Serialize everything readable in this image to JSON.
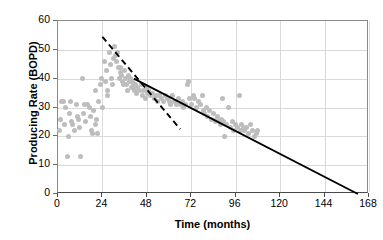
{
  "chart_data": {
    "type": "scatter",
    "title": "",
    "xlabel": "Time (months)",
    "ylabel": "Producing Rate (BOPD)",
    "xlim": [
      0,
      168
    ],
    "ylim": [
      0,
      60
    ],
    "xticks": [
      0,
      24,
      48,
      72,
      96,
      120,
      144,
      168
    ],
    "yticks": [
      0,
      10,
      20,
      30,
      40,
      50,
      60
    ],
    "grid": true,
    "legend": "none",
    "series": [
      {
        "name": "Producing rate data",
        "type": "scatter",
        "marker": "circle",
        "color": "#bdbdbd",
        "points": [
          [
            1,
            22
          ],
          [
            1.5,
            26
          ],
          [
            2,
            32
          ],
          [
            3,
            32
          ],
          [
            3.5,
            24
          ],
          [
            4,
            30
          ],
          [
            5,
            13
          ],
          [
            5.5,
            20
          ],
          [
            6,
            28
          ],
          [
            7,
            32
          ],
          [
            7.5,
            25
          ],
          [
            8,
            24
          ],
          [
            9,
            22
          ],
          [
            10,
            31
          ],
          [
            10.5,
            27
          ],
          [
            11,
            26
          ],
          [
            11.5,
            23
          ],
          [
            12,
            13
          ],
          [
            13,
            40
          ],
          [
            14,
            28
          ],
          [
            14.5,
            31
          ],
          [
            15,
            25
          ],
          [
            16,
            31
          ],
          [
            17,
            30
          ],
          [
            17.5,
            27
          ],
          [
            18,
            22
          ],
          [
            18.5,
            21
          ],
          [
            19,
            29
          ],
          [
            20,
            36
          ],
          [
            20.5,
            24
          ],
          [
            21,
            26
          ],
          [
            21.5,
            21
          ],
          [
            22,
            32
          ],
          [
            23,
            38
          ],
          [
            23.5,
            40
          ],
          [
            24,
            30
          ],
          [
            25,
            46
          ],
          [
            25.5,
            39
          ],
          [
            26,
            43
          ],
          [
            26.5,
            36
          ],
          [
            27,
            34
          ],
          [
            28,
            49
          ],
          [
            28.5,
            45
          ],
          [
            29,
            40
          ],
          [
            29.5,
            38
          ],
          [
            30,
            47
          ],
          [
            30.5,
            51
          ],
          [
            31,
            48
          ],
          [
            31.5,
            46
          ],
          [
            32,
            49
          ],
          [
            32.5,
            44
          ],
          [
            33,
            40
          ],
          [
            33.5,
            42
          ],
          [
            34,
            44
          ],
          [
            34.5,
            41
          ],
          [
            35,
            39
          ],
          [
            35.5,
            38
          ],
          [
            36,
            43
          ],
          [
            36.5,
            40
          ],
          [
            37,
            38
          ],
          [
            37.5,
            36
          ],
          [
            38,
            41
          ],
          [
            38.5,
            39
          ],
          [
            39,
            40
          ],
          [
            39.5,
            37
          ],
          [
            40,
            39
          ],
          [
            40.5,
            37
          ],
          [
            41,
            38
          ],
          [
            41.5,
            36
          ],
          [
            42,
            38
          ],
          [
            42.5,
            35
          ],
          [
            43,
            37
          ],
          [
            44,
            36
          ],
          [
            45,
            38
          ],
          [
            45.5,
            34
          ],
          [
            46,
            36
          ],
          [
            47,
            33
          ],
          [
            48,
            37
          ],
          [
            48.5,
            35
          ],
          [
            49,
            36
          ],
          [
            50,
            34
          ],
          [
            51,
            35
          ],
          [
            52,
            33
          ],
          [
            53,
            34
          ],
          [
            54,
            32
          ],
          [
            55,
            34
          ],
          [
            56,
            33
          ],
          [
            57,
            32
          ],
          [
            58,
            34
          ],
          [
            59,
            33
          ],
          [
            60,
            32
          ],
          [
            61,
            31
          ],
          [
            62,
            34
          ],
          [
            63,
            32
          ],
          [
            64,
            31
          ],
          [
            65,
            33
          ],
          [
            66,
            31
          ],
          [
            67,
            32
          ],
          [
            68,
            30
          ],
          [
            69,
            31
          ],
          [
            70,
            38
          ],
          [
            70.5,
            39
          ],
          [
            71,
            33
          ],
          [
            72,
            31
          ],
          [
            73,
            34
          ],
          [
            74,
            33
          ],
          [
            75,
            30
          ],
          [
            76,
            32
          ],
          [
            77,
            31
          ],
          [
            78,
            34
          ],
          [
            78.5,
            29
          ],
          [
            79,
            28
          ],
          [
            80,
            30
          ],
          [
            81,
            27
          ],
          [
            82,
            29
          ],
          [
            83,
            26
          ],
          [
            84,
            28
          ],
          [
            85,
            25
          ],
          [
            85.5,
            26
          ],
          [
            86,
            27
          ],
          [
            87,
            25
          ],
          [
            88,
            24
          ],
          [
            88.5,
            26
          ],
          [
            89,
            33
          ],
          [
            89.5,
            25
          ],
          [
            90,
            20
          ],
          [
            91,
            24
          ],
          [
            92,
            30
          ],
          [
            93,
            23
          ],
          [
            94,
            25
          ],
          [
            95,
            22
          ],
          [
            96,
            24
          ],
          [
            97,
            23
          ],
          [
            98,
            34
          ],
          [
            98.5,
            22
          ],
          [
            99,
            24
          ],
          [
            100,
            23
          ],
          [
            101,
            22
          ],
          [
            102,
            23
          ],
          [
            103,
            21
          ],
          [
            104,
            24
          ],
          [
            105,
            22
          ],
          [
            106,
            20
          ],
          [
            107,
            21
          ],
          [
            108,
            22
          ]
        ]
      },
      {
        "name": "Exponential early-decline fit",
        "type": "line",
        "style": "dashed",
        "color": "#000000",
        "points": [
          [
            24,
            54.5
          ],
          [
            66,
            22.5
          ]
        ]
      },
      {
        "name": "Linear decline trend",
        "type": "line",
        "style": "solid",
        "color": "#000000",
        "points": [
          [
            41,
            40
          ],
          [
            162,
            0
          ]
        ]
      }
    ]
  },
  "axes": {
    "x_title": "Time (months)",
    "y_title": "Producing Rate (BOPD)",
    "x_tick_labels": [
      "0",
      "24",
      "48",
      "72",
      "96",
      "120",
      "144",
      "168"
    ],
    "y_tick_labels": [
      "0",
      "10",
      "20",
      "30",
      "40",
      "50",
      "60"
    ]
  },
  "colors": {
    "marker": "#bdbdbd",
    "line": "#000000",
    "grid": "#d9d9d9",
    "axis": "#4a4a4a",
    "background": "#ffffff"
  }
}
